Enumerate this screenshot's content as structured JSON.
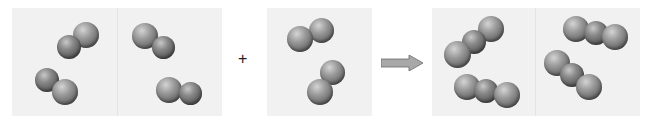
{
  "diagram": {
    "reactant_1": {
      "label": "",
      "molecule_count": 4,
      "atoms_per_molecule": 2
    },
    "operator_plus": "+",
    "reactant_2": {
      "label": "",
      "molecule_count": 2,
      "atoms_per_molecule": 2
    },
    "arrow": "reaction-arrow",
    "product": {
      "label": "",
      "molecule_count": 4,
      "atoms_per_molecule": 3
    },
    "colors": {
      "panel_bg": "#f1f1f1",
      "atom": "#7a7a7a",
      "arrow": "#a0a0a0"
    }
  }
}
